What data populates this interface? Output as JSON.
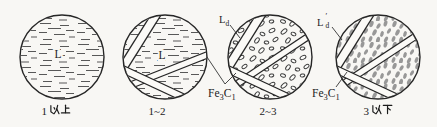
{
  "page": {
    "background": "#f8f7f4"
  },
  "colors": {
    "line": "#262626",
    "dash_stroke": "#585858",
    "oval_stroke": "#3c3c3c",
    "blob_fill": "#989898",
    "band_fill": "#fbfaf7",
    "text": "#1c1c1c"
  },
  "figures": [
    {
      "caption": "1以上",
      "caption_num": "1",
      "caption_cjk": "以上",
      "label": "L",
      "pattern": "liquid-dash-pattern"
    },
    {
      "caption": "1~2",
      "label": "L",
      "pattern": "liquid-dash-pattern-with-cementite-bands"
    },
    {
      "caption": "2~3",
      "pattern": "ledeburite-oval-pattern-with-cementite-bands"
    },
    {
      "caption": "3以下",
      "caption_num": "3",
      "caption_cjk": "以下",
      "pattern": "transformed-ledeburite-blob-pattern-with-cementite-bands"
    }
  ],
  "annotations": {
    "ld": {
      "base": "L",
      "sub": "d"
    },
    "ld_prime": {
      "base": "L",
      "prime": "′",
      "sub": "d"
    },
    "fe3c": {
      "el1": "Fe",
      "sub1": "3",
      "el2": "C",
      "sub2": "1"
    }
  }
}
